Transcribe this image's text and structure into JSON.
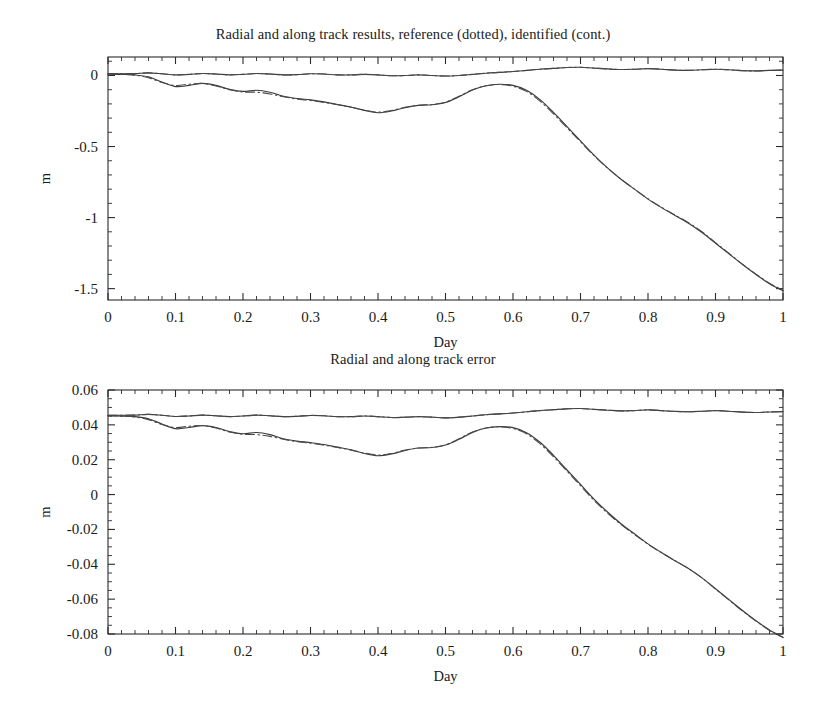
{
  "figure": {
    "background_color": "#ffffff",
    "line_color": "#3a3a3a"
  },
  "panels": [
    {
      "id": "radial-along-track-results",
      "title": "Radial and along track results, reference (dotted), identified (cont.)",
      "ylabel": "m",
      "xlabel": "Day",
      "xticklabels": [
        "0",
        "0.1",
        "0.2",
        "0.3",
        "0.4",
        "0.5",
        "0.6",
        "0.7",
        "0.8",
        "0.9",
        "1"
      ],
      "yticklabels": [
        "0",
        "-0.5",
        "-1",
        "-1.5"
      ]
    },
    {
      "id": "radial-along-track-error",
      "title": "Radial and along track error",
      "ylabel": "m",
      "xlabel": "Day",
      "xticklabels": [
        "0",
        "0.1",
        "0.2",
        "0.3",
        "0.4",
        "0.5",
        "0.6",
        "0.7",
        "0.8",
        "0.9",
        "1"
      ],
      "yticklabels": [
        "0.06",
        "0.04",
        "0.02",
        "0",
        "-0.02",
        "-0.04",
        "-0.06",
        "-0.08"
      ]
    }
  ],
  "chart_data": [
    {
      "type": "line",
      "title": "Radial and along track results, reference (dotted), identified (cont.)",
      "xlabel": "Day",
      "ylabel": "m",
      "xlim": [
        0,
        1
      ],
      "ylim": [
        -1.58,
        0.13
      ],
      "xticks": [
        0,
        0.1,
        0.2,
        0.3,
        0.4,
        0.5,
        0.6,
        0.7,
        0.8,
        0.9,
        1
      ],
      "yticks": [
        0,
        -0.5,
        -1,
        -1.5
      ],
      "minor_ticks": true,
      "grid": false,
      "legend": "none",
      "legend_note": "reference (dotted), identified (cont.)",
      "x": [
        0,
        0.02,
        0.04,
        0.06,
        0.08,
        0.1,
        0.12,
        0.14,
        0.16,
        0.18,
        0.2,
        0.22,
        0.24,
        0.26,
        0.28,
        0.3,
        0.32,
        0.34,
        0.36,
        0.38,
        0.4,
        0.42,
        0.44,
        0.46,
        0.48,
        0.5,
        0.52,
        0.54,
        0.56,
        0.58,
        0.6,
        0.62,
        0.64,
        0.66,
        0.68,
        0.7,
        0.72,
        0.74,
        0.76,
        0.78,
        0.8,
        0.82,
        0.84,
        0.86,
        0.88,
        0.9,
        0.92,
        0.94,
        0.96,
        0.98,
        1
      ],
      "series": [
        {
          "name": "radial identified (cont.)",
          "style": "solid",
          "values": [
            0.012,
            0.012,
            0.013,
            0.018,
            0.012,
            0.004,
            0.008,
            0.014,
            0.01,
            0.004,
            0.008,
            0.014,
            0.01,
            0.004,
            0.006,
            0.012,
            0.01,
            0.004,
            0.004,
            0.008,
            0.004,
            -0.002,
            0.0,
            0.004,
            0.0,
            -0.004,
            0.0,
            0.008,
            0.016,
            0.022,
            0.028,
            0.036,
            0.044,
            0.05,
            0.056,
            0.058,
            0.052,
            0.046,
            0.042,
            0.044,
            0.048,
            0.044,
            0.038,
            0.036,
            0.04,
            0.044,
            0.04,
            0.034,
            0.032,
            0.036,
            0.038
          ]
        },
        {
          "name": "radial reference (dotted)",
          "style": "dashdot",
          "values": [
            0.012,
            0.012,
            0.013,
            0.018,
            0.012,
            0.004,
            0.008,
            0.014,
            0.01,
            0.004,
            0.008,
            0.014,
            0.01,
            0.004,
            0.006,
            0.012,
            0.01,
            0.004,
            0.004,
            0.008,
            0.004,
            -0.002,
            0.0,
            0.004,
            0.0,
            -0.004,
            0.0,
            0.008,
            0.016,
            0.022,
            0.028,
            0.036,
            0.044,
            0.05,
            0.056,
            0.058,
            0.052,
            0.046,
            0.042,
            0.044,
            0.048,
            0.044,
            0.038,
            0.036,
            0.04,
            0.044,
            0.04,
            0.034,
            0.032,
            0.036,
            0.038
          ]
        },
        {
          "name": "along track identified (cont.)",
          "style": "solid",
          "values": [
            0.01,
            0.008,
            0.004,
            -0.01,
            -0.046,
            -0.078,
            -0.07,
            -0.056,
            -0.07,
            -0.098,
            -0.112,
            -0.104,
            -0.118,
            -0.146,
            -0.162,
            -0.172,
            -0.186,
            -0.204,
            -0.222,
            -0.246,
            -0.262,
            -0.25,
            -0.226,
            -0.21,
            -0.206,
            -0.19,
            -0.15,
            -0.102,
            -0.072,
            -0.062,
            -0.07,
            -0.104,
            -0.17,
            -0.26,
            -0.36,
            -0.46,
            -0.56,
            -0.65,
            -0.73,
            -0.8,
            -0.87,
            -0.93,
            -0.985,
            -1.04,
            -1.105,
            -1.18,
            -1.255,
            -1.33,
            -1.4,
            -1.465,
            -1.515
          ]
        },
        {
          "name": "along track reference (dotted)",
          "style": "dashdot",
          "values": [
            0.01,
            0.008,
            0.002,
            -0.016,
            -0.05,
            -0.07,
            -0.062,
            -0.056,
            -0.074,
            -0.1,
            -0.116,
            -0.118,
            -0.13,
            -0.15,
            -0.166,
            -0.176,
            -0.19,
            -0.206,
            -0.224,
            -0.244,
            -0.258,
            -0.246,
            -0.224,
            -0.21,
            -0.204,
            -0.188,
            -0.146,
            -0.1,
            -0.072,
            -0.064,
            -0.076,
            -0.112,
            -0.18,
            -0.27,
            -0.368,
            -0.466,
            -0.564,
            -0.652,
            -0.73,
            -0.8,
            -0.868,
            -0.928,
            -0.982,
            -1.036,
            -1.1,
            -1.176,
            -1.252,
            -1.328,
            -1.398,
            -1.462,
            -1.512
          ]
        }
      ]
    },
    {
      "type": "line",
      "title": "Radial and along track error",
      "xlabel": "Day",
      "ylabel": "m",
      "xlim": [
        0,
        1
      ],
      "ylim": [
        -0.08,
        0.06
      ],
      "xticks": [
        0,
        0.1,
        0.2,
        0.3,
        0.4,
        0.5,
        0.6,
        0.7,
        0.8,
        0.9,
        1
      ],
      "yticks": [
        0.06,
        0.04,
        0.02,
        0,
        -0.02,
        -0.04,
        -0.06,
        -0.08
      ],
      "minor_ticks": true,
      "grid": false,
      "legend": "none",
      "x": [
        0,
        0.02,
        0.04,
        0.06,
        0.08,
        0.1,
        0.12,
        0.14,
        0.16,
        0.18,
        0.2,
        0.22,
        0.24,
        0.26,
        0.28,
        0.3,
        0.32,
        0.34,
        0.36,
        0.38,
        0.4,
        0.42,
        0.44,
        0.46,
        0.48,
        0.5,
        0.52,
        0.54,
        0.56,
        0.58,
        0.6,
        0.62,
        0.64,
        0.66,
        0.68,
        0.7,
        0.72,
        0.74,
        0.76,
        0.78,
        0.8,
        0.82,
        0.84,
        0.86,
        0.88,
        0.9,
        0.92,
        0.94,
        0.96,
        0.98,
        1
      ],
      "series": [
        {
          "name": "radial error identified (cont.)",
          "style": "solid",
          "values": [
            0.0455,
            0.0455,
            0.0456,
            0.046,
            0.0455,
            0.0448,
            0.0451,
            0.0456,
            0.0452,
            0.0447,
            0.0451,
            0.0456,
            0.0452,
            0.0447,
            0.0449,
            0.0454,
            0.0452,
            0.0447,
            0.0447,
            0.0451,
            0.0447,
            0.0442,
            0.0444,
            0.0447,
            0.0444,
            0.044,
            0.0444,
            0.0451,
            0.0458,
            0.0463,
            0.0468,
            0.0475,
            0.0482,
            0.0487,
            0.0492,
            0.0494,
            0.0489,
            0.0484,
            0.048,
            0.0482,
            0.0486,
            0.0482,
            0.0477,
            0.0475,
            0.0478,
            0.0482,
            0.0478,
            0.0473,
            0.0471,
            0.0474,
            0.0476
          ]
        },
        {
          "name": "radial error reference (dotted)",
          "style": "dashdot",
          "values": [
            0.0455,
            0.0455,
            0.0456,
            0.046,
            0.0455,
            0.0448,
            0.0451,
            0.0456,
            0.0452,
            0.0447,
            0.0451,
            0.0456,
            0.0452,
            0.0447,
            0.0449,
            0.0454,
            0.0452,
            0.0447,
            0.0447,
            0.0451,
            0.0447,
            0.0442,
            0.0444,
            0.0447,
            0.0444,
            0.044,
            0.0444,
            0.0451,
            0.0458,
            0.0463,
            0.0468,
            0.0475,
            0.0482,
            0.0487,
            0.0492,
            0.0494,
            0.0489,
            0.0484,
            0.048,
            0.0482,
            0.0486,
            0.0482,
            0.0477,
            0.0475,
            0.0478,
            0.0482,
            0.0478,
            0.0473,
            0.0471,
            0.0474,
            0.0476
          ]
        },
        {
          "name": "along track error identified (cont.)",
          "style": "solid",
          "values": [
            0.0452,
            0.045,
            0.0447,
            0.0435,
            0.0405,
            0.0378,
            0.0385,
            0.0396,
            0.0385,
            0.0361,
            0.0349,
            0.0356,
            0.0344,
            0.032,
            0.0307,
            0.0298,
            0.0287,
            0.0272,
            0.0257,
            0.0236,
            0.0223,
            0.0233,
            0.0253,
            0.0267,
            0.027,
            0.0284,
            0.0317,
            0.0357,
            0.0382,
            0.039,
            0.0384,
            0.0355,
            0.03,
            0.0225,
            0.0141,
            0.0058,
            -0.0026,
            -0.01,
            -0.0167,
            -0.0225,
            -0.0283,
            -0.0333,
            -0.0379,
            -0.0424,
            -0.0478,
            -0.054,
            -0.0603,
            -0.0665,
            -0.0724,
            -0.0777,
            -0.0819
          ]
        },
        {
          "name": "along track error reference (dotted)",
          "style": "dashdot",
          "values": [
            0.0452,
            0.045,
            0.0445,
            0.043,
            0.0402,
            0.0385,
            0.0392,
            0.0396,
            0.0382,
            0.0359,
            0.0346,
            0.0344,
            0.0334,
            0.0317,
            0.0303,
            0.0295,
            0.0283,
            0.027,
            0.0255,
            0.0238,
            0.0227,
            0.0236,
            0.0255,
            0.0267,
            0.0271,
            0.0285,
            0.032,
            0.0359,
            0.0382,
            0.0389,
            0.0379,
            0.0349,
            0.0292,
            0.0217,
            0.0135,
            0.0051,
            -0.0033,
            -0.0106,
            -0.0172,
            -0.0229,
            -0.0285,
            -0.0334,
            -0.038,
            -0.0425,
            -0.0478,
            -0.0542,
            -0.0605,
            -0.0668,
            -0.0726,
            -0.078,
            -0.0821
          ]
        }
      ]
    }
  ]
}
